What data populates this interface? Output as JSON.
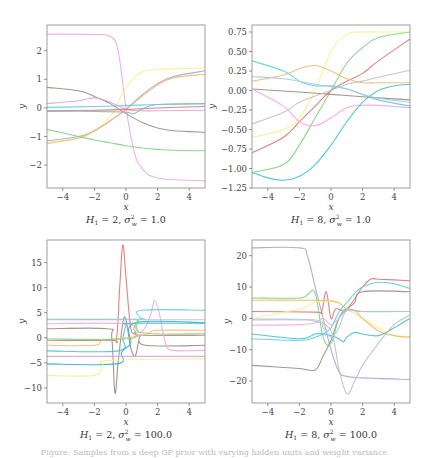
{
  "figure": {
    "caption": "Figure: Samples from a deep GP prior with varying hidden units and weight variance"
  },
  "chart_data": [
    {
      "type": "line",
      "title": "H_1 = 2, σ_w^2 = 1.0",
      "xlabel": "x",
      "ylabel": "y",
      "xlim": [
        -5,
        5
      ],
      "ylim": [
        -2.8,
        2.9
      ],
      "xticks": [
        -4,
        -2,
        0,
        2,
        4
      ],
      "yticks": [
        -2,
        -1,
        0,
        1,
        2
      ],
      "grid": false,
      "box": {
        "x": 47,
        "y": 25,
        "w": 158,
        "h": 163
      },
      "series": [
        {
          "name": "s1",
          "color": "#f4a6e6",
          "x": [
            -5,
            -2,
            -1,
            -0.5,
            0,
            0.5,
            1,
            2,
            5
          ],
          "y": [
            2.58,
            2.57,
            2.5,
            2.0,
            0.0,
            -1.5,
            -2.1,
            -2.45,
            -2.55
          ]
        },
        {
          "name": "s2",
          "color": "#f9f08a",
          "x": [
            -5,
            -3,
            -2,
            -1,
            -0.5,
            0,
            0.5,
            1,
            2,
            5
          ],
          "y": [
            -1.2,
            -1.05,
            -0.8,
            -0.3,
            0.2,
            0.7,
            1.05,
            1.25,
            1.35,
            1.4
          ]
        },
        {
          "name": "s3",
          "color": "#a6a6d6",
          "x": [
            -5,
            -3,
            -2,
            -1,
            0,
            1,
            2,
            3,
            5
          ],
          "y": [
            -1.15,
            -1.0,
            -0.8,
            -0.45,
            -0.05,
            0.45,
            0.85,
            1.1,
            1.3
          ]
        },
        {
          "name": "s4",
          "color": "#f6b86a",
          "x": [
            -5,
            -3,
            -2,
            -1,
            0,
            1,
            2,
            3,
            5
          ],
          "y": [
            -1.25,
            -1.05,
            -0.8,
            -0.45,
            -0.05,
            0.4,
            0.8,
            1.05,
            1.18
          ]
        },
        {
          "name": "s5",
          "color": "#9b8a7e",
          "x": [
            -5,
            -3,
            -2,
            -1,
            0,
            1,
            2,
            3,
            5
          ],
          "y": [
            0.72,
            0.6,
            0.4,
            0.15,
            -0.2,
            -0.5,
            -0.7,
            -0.8,
            -0.85
          ]
        },
        {
          "name": "s6",
          "color": "#7cd67c",
          "x": [
            -5,
            -3,
            -2,
            -1,
            0,
            1,
            2,
            3,
            5
          ],
          "y": [
            -0.75,
            -1.0,
            -1.12,
            -1.22,
            -1.32,
            -1.4,
            -1.45,
            -1.48,
            -1.5
          ]
        },
        {
          "name": "s7",
          "color": "#56d2e8",
          "x": [
            -5,
            -2,
            0,
            2,
            5
          ],
          "y": [
            0.02,
            0.05,
            0.08,
            0.12,
            0.15
          ]
        },
        {
          "name": "s8",
          "color": "#d9a3f0",
          "x": [
            -5,
            -3,
            -2,
            -1,
            0,
            1,
            2,
            5
          ],
          "y": [
            0.15,
            0.25,
            0.35,
            0.2,
            -0.05,
            -0.1,
            -0.1,
            -0.08
          ]
        },
        {
          "name": "s9",
          "color": "#e57373",
          "x": [
            -5,
            -2,
            0,
            2,
            5
          ],
          "y": [
            -0.1,
            -0.08,
            -0.05,
            0.0,
            0.05
          ]
        },
        {
          "name": "s10",
          "color": "#8fb4c9",
          "x": [
            -5,
            -2,
            0,
            0.5,
            1,
            2,
            5
          ],
          "y": [
            -0.12,
            -0.12,
            -0.15,
            -0.2,
            -0.05,
            0.12,
            0.15
          ]
        }
      ]
    },
    {
      "type": "line",
      "title": "H_1 = 8, σ_w^2 = 1.0",
      "xlabel": "x",
      "ylabel": "y",
      "xlim": [
        -5,
        5
      ],
      "ylim": [
        -1.25,
        0.84
      ],
      "xticks": [
        -4,
        -2,
        0,
        2,
        4
      ],
      "yticks": [
        -1.25,
        -1.0,
        -0.75,
        -0.5,
        -0.25,
        0.0,
        0.25,
        0.5,
        0.75
      ],
      "grid": false,
      "box": {
        "x": 252,
        "y": 25,
        "w": 158,
        "h": 163
      },
      "series": [
        {
          "name": "s1",
          "color": "#f9f08a",
          "x": [
            -5,
            -3,
            -2,
            -1,
            0,
            1,
            2,
            3,
            5
          ],
          "y": [
            -0.6,
            -0.5,
            -0.35,
            0.0,
            0.5,
            0.72,
            0.75,
            0.75,
            0.75
          ]
        },
        {
          "name": "s2",
          "color": "#7cd67c",
          "x": [
            -5,
            -3,
            -2,
            -1,
            0,
            1,
            2,
            3,
            5
          ],
          "y": [
            -1.05,
            -0.95,
            -0.7,
            -0.35,
            0.0,
            0.35,
            0.55,
            0.68,
            0.75
          ]
        },
        {
          "name": "s3",
          "color": "#e57373",
          "x": [
            -5,
            -3,
            -2,
            -1,
            0,
            1,
            2,
            3,
            5
          ],
          "y": [
            -0.8,
            -0.6,
            -0.4,
            -0.2,
            0.0,
            0.12,
            0.22,
            0.38,
            0.66
          ]
        },
        {
          "name": "s4",
          "color": "#f6b86a",
          "x": [
            -5,
            -3,
            -2,
            -1,
            0,
            1,
            2,
            3,
            5
          ],
          "y": [
            0.12,
            0.2,
            0.28,
            0.32,
            0.25,
            0.15,
            0.1,
            0.1,
            0.1
          ]
        },
        {
          "name": "s5",
          "color": "#56d2e8",
          "x": [
            -5,
            -3,
            -2,
            -1,
            0,
            1,
            2,
            3,
            5
          ],
          "y": [
            0.38,
            0.25,
            0.12,
            0.06,
            0.06,
            0.02,
            -0.05,
            -0.12,
            -0.2
          ]
        },
        {
          "name": "s6",
          "color": "#9b8a7e",
          "x": [
            -5,
            -2,
            0,
            2,
            5
          ],
          "y": [
            0.02,
            -0.02,
            -0.05,
            -0.08,
            -0.12
          ]
        },
        {
          "name": "s7",
          "color": "#c0c0c0",
          "x": [
            -5,
            -3,
            -2,
            -1,
            0,
            1,
            2,
            3,
            5
          ],
          "y": [
            -0.43,
            -0.28,
            -0.15,
            -0.07,
            0.0,
            0.08,
            0.12,
            0.17,
            0.26
          ]
        },
        {
          "name": "s8",
          "color": "#f4a6e6",
          "x": [
            -5,
            -3,
            -2,
            -1,
            0,
            1,
            2,
            3,
            5
          ],
          "y": [
            0.02,
            -0.2,
            -0.4,
            -0.45,
            -0.35,
            -0.22,
            -0.19,
            -0.19,
            -0.22
          ]
        },
        {
          "name": "s9",
          "color": "#3fc1d9",
          "x": [
            -5,
            -4,
            -3,
            -2,
            -1,
            0,
            1,
            2,
            3,
            4,
            5
          ],
          "y": [
            -1.05,
            -1.12,
            -1.15,
            -1.1,
            -0.95,
            -0.7,
            -0.4,
            -0.15,
            0.0,
            0.06,
            0.08
          ]
        },
        {
          "name": "s10",
          "color": "#a6c8e6",
          "x": [
            -5,
            -3,
            -1,
            0,
            1,
            2,
            3,
            5
          ],
          "y": [
            0.18,
            0.15,
            0.08,
            0.05,
            0.02,
            -0.05,
            -0.1,
            -0.15
          ]
        }
      ]
    },
    {
      "type": "line",
      "title": "H_1 = 2, σ_w^2 = 100.0",
      "xlabel": "x",
      "ylabel": "y",
      "xlim": [
        -5,
        5
      ],
      "ylim": [
        -13,
        19.5
      ],
      "xticks": [
        -4,
        -2,
        0,
        2,
        4
      ],
      "yticks": [
        -10,
        -5,
        0,
        5,
        10,
        15
      ],
      "grid": false,
      "box": {
        "x": 47,
        "y": 240,
        "w": 158,
        "h": 163
      },
      "series": [
        {
          "name": "s1",
          "color": "#e57373",
          "x": [
            -5,
            -1,
            -0.6,
            -0.4,
            -0.2,
            0,
            0.3,
            0.6,
            1,
            5
          ],
          "y": [
            -0.5,
            -0.5,
            0,
            10,
            18.5,
            12,
            2,
            1,
            0.5,
            0.5
          ]
        },
        {
          "name": "s2",
          "color": "#9b8a7e",
          "x": [
            -5,
            -1.2,
            -0.9,
            -0.7,
            -0.5,
            -0.2,
            0,
            0.3,
            0.6,
            0.9,
            1.2,
            5
          ],
          "y": [
            1.8,
            1.8,
            0,
            -11,
            -5,
            3,
            3.5,
            -2,
            -3.5,
            0.5,
            -1.5,
            -1.5
          ]
        },
        {
          "name": "s3",
          "color": "#f4a6e6",
          "x": [
            -5,
            0,
            0.8,
            1.2,
            1.6,
            1.8,
            2.1,
            2.5,
            3,
            5
          ],
          "y": [
            2.8,
            2.8,
            1,
            2,
            5,
            7.5,
            5,
            -1,
            -2.5,
            -2.5
          ]
        },
        {
          "name": "s4",
          "color": "#56d2e8",
          "x": [
            -5,
            0.7,
            0.9,
            1,
            5
          ],
          "y": [
            3.7,
            3.7,
            4,
            5.5,
            5.5
          ]
        },
        {
          "name": "s5",
          "color": "#3fc1d9",
          "x": [
            -5,
            -0.5,
            -0.2,
            0,
            0.3,
            5
          ],
          "y": [
            -2.6,
            -2.6,
            0,
            2.5,
            2.9,
            2.9
          ]
        },
        {
          "name": "s6",
          "color": "#36a8e0",
          "x": [
            -5,
            -0.6,
            -0.3,
            0,
            0.3,
            0.6,
            5
          ],
          "y": [
            -5.2,
            -5.2,
            -3,
            -2,
            -1,
            3,
            3
          ]
        },
        {
          "name": "s7",
          "color": "#f9f08a",
          "x": [
            -5,
            -2,
            -1.5,
            -1,
            5
          ],
          "y": [
            -7.5,
            -7.5,
            -5.5,
            -4.5,
            -4.2
          ]
        },
        {
          "name": "s8",
          "color": "#f6b86a",
          "x": [
            -5,
            -2,
            -1.5,
            0,
            1,
            1.5,
            2,
            5
          ],
          "y": [
            -1.5,
            -1.5,
            -0.5,
            0,
            0.5,
            1,
            1.5,
            1.5
          ]
        },
        {
          "name": "s9",
          "color": "#7cd67c",
          "x": [
            -5,
            0.2,
            0.5,
            0.8,
            1,
            5
          ],
          "y": [
            -0.2,
            -0.2,
            2,
            3.5,
            1,
            0.8
          ]
        },
        {
          "name": "s10",
          "color": "#d9a3f0",
          "x": [
            -5,
            5
          ],
          "y": [
            -3.7,
            -3.7
          ]
        },
        {
          "name": "s11",
          "color": "#c0c0c0",
          "x": [
            -5,
            5
          ],
          "y": [
            3.6,
            3.6
          ]
        }
      ]
    },
    {
      "type": "line",
      "title": "H_1 = 8, σ_w^2 = 100.0",
      "xlabel": "x",
      "ylabel": "y",
      "xlim": [
        -5,
        5
      ],
      "ylim": [
        -27,
        25
      ],
      "xticks": [
        -4,
        -2,
        0,
        2,
        4
      ],
      "yticks": [
        -20,
        -10,
        0,
        10,
        20
      ],
      "grid": false,
      "box": {
        "x": 252,
        "y": 240,
        "w": 158,
        "h": 163
      },
      "series": [
        {
          "name": "s1",
          "color": "#a6a6d6",
          "x": [
            -5,
            -2,
            -1.5,
            -1,
            -0.5,
            0,
            0.5,
            1,
            2,
            5
          ],
          "y": [
            22.5,
            22.5,
            20,
            10,
            0,
            -10,
            -17,
            -18.5,
            -19,
            -19.5
          ]
        },
        {
          "name": "s2",
          "color": "#9b8a7e",
          "x": [
            -5,
            -2,
            -1,
            -0.5,
            0,
            0.5,
            1,
            1.5,
            2,
            5
          ],
          "y": [
            -15,
            -16,
            -16.5,
            -12,
            -7,
            0,
            3,
            5,
            8.5,
            8.5
          ]
        },
        {
          "name": "s3",
          "color": "#e57373",
          "x": [
            -5,
            -1,
            -0.6,
            -0.3,
            0,
            0.3,
            1,
            2,
            2.5,
            3,
            5
          ],
          "y": [
            2.2,
            2,
            2,
            8.5,
            0,
            3,
            3,
            10,
            12.5,
            12.5,
            12
          ]
        },
        {
          "name": "s4",
          "color": "#7cd67c",
          "x": [
            -5,
            -2,
            -1.5,
            -1,
            -0.5,
            0,
            0.5,
            1,
            2,
            5
          ],
          "y": [
            6.5,
            6.5,
            7.5,
            8,
            -6,
            -8,
            0,
            3,
            2.2,
            2.2
          ]
        },
        {
          "name": "s5",
          "color": "#f9f08a",
          "x": [
            -5,
            -2,
            -1,
            0,
            0.5,
            1,
            2,
            3,
            4,
            5
          ],
          "y": [
            0,
            3,
            5,
            5.5,
            5,
            3,
            0,
            -3,
            -5.5,
            -6
          ]
        },
        {
          "name": "s6",
          "color": "#f6b86a",
          "x": [
            -5,
            -1,
            0,
            0.5,
            1,
            1.5,
            2,
            3,
            4,
            5
          ],
          "y": [
            5.8,
            5.8,
            5.5,
            5,
            3,
            2.5,
            0,
            -4,
            -5.5,
            -6
          ]
        },
        {
          "name": "s7",
          "color": "#56d2e8",
          "x": [
            -5,
            -2,
            -1,
            -0.5,
            0,
            0.5,
            1,
            1.5,
            2,
            3,
            4,
            5
          ],
          "y": [
            -6.5,
            -7,
            -6,
            -5,
            -3,
            2,
            5,
            8,
            10,
            11.5,
            11,
            9.5
          ]
        },
        {
          "name": "s8",
          "color": "#3fc1d9",
          "x": [
            -5,
            -2,
            -1,
            -0.5,
            0,
            0.5,
            0.8,
            1,
            1.5,
            2,
            3,
            4,
            5
          ],
          "y": [
            -5,
            -6.5,
            -5,
            -5,
            -5.5,
            -6.5,
            -7.5,
            -6,
            -4.5,
            -5,
            -5.5,
            -3,
            0
          ]
        },
        {
          "name": "s9",
          "color": "#f4a6e6",
          "x": [
            -5,
            -2,
            -1,
            -0.5,
            0,
            0.5,
            1,
            2,
            5
          ],
          "y": [
            -2.2,
            -2,
            -1.5,
            0,
            -2,
            0,
            2.5,
            2.2,
            2.2
          ]
        },
        {
          "name": "s10",
          "color": "#c0c0c0",
          "x": [
            -5,
            -2,
            -1,
            0,
            0.5,
            1,
            1.5,
            2,
            3,
            4,
            5
          ],
          "y": [
            -0.5,
            -0.5,
            -1,
            -4,
            -16,
            -24,
            -20,
            -15,
            -8,
            -2,
            1
          ]
        },
        {
          "name": "s11",
          "color": "#a6c8e6",
          "x": [
            -5,
            -1,
            -0.5,
            0,
            0.5,
            1,
            2,
            5
          ],
          "y": [
            -0.2,
            -0.5,
            -3,
            -6,
            -3,
            2.5,
            2.2,
            2.2
          ]
        }
      ]
    }
  ]
}
